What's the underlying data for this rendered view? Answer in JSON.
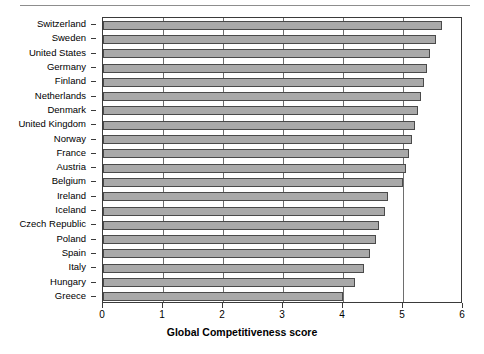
{
  "chart_data": {
    "type": "bar",
    "orientation": "horizontal",
    "title": "",
    "xlabel": "Global Competitiveness score",
    "ylabel": "",
    "xlim": [
      0,
      6
    ],
    "xticks": [
      0,
      1,
      2,
      3,
      4,
      5,
      6
    ],
    "xtick_labels": [
      "0",
      "1",
      "2",
      "3",
      "4",
      "5",
      "6"
    ],
    "grid": true,
    "grid_axis": "x",
    "legend": false,
    "bar_color": "#a9a9a9",
    "bar_edge_color": "#4a4a4a",
    "categories": [
      "Switzerland",
      "Sweden",
      "United States",
      "Germany",
      "Finland",
      "Netherlands",
      "Denmark",
      "United Kingdom",
      "Norway",
      "France",
      "Austria",
      "Belgium",
      "Ireland",
      "Iceland",
      "Czech Republic",
      "Poland",
      "Spain",
      "Italy",
      "Hungary",
      "Greece"
    ],
    "values": [
      5.65,
      5.55,
      5.45,
      5.4,
      5.35,
      5.3,
      5.25,
      5.2,
      5.15,
      5.1,
      5.05,
      5.0,
      4.75,
      4.7,
      4.6,
      4.55,
      4.45,
      4.35,
      4.2,
      4.0
    ]
  }
}
